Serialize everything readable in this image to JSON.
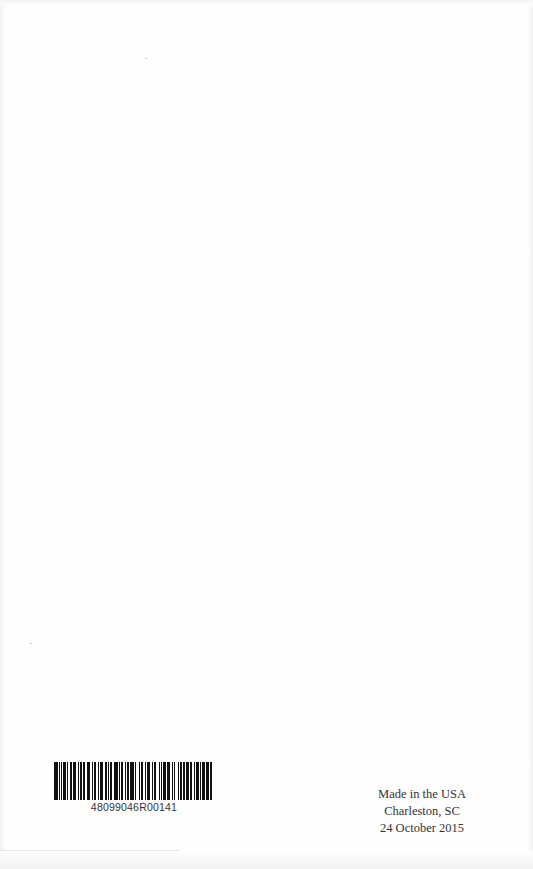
{
  "page": {
    "background": "#fefefe"
  },
  "barcode": {
    "number": "48099046R00141",
    "pattern": [
      3,
      1,
      1,
      1,
      1,
      1,
      2,
      1,
      1,
      2,
      1,
      1,
      3,
      1,
      1,
      1,
      2,
      1,
      1,
      2,
      3,
      1,
      1,
      1,
      2,
      1,
      1,
      1,
      3,
      1,
      2,
      1,
      1,
      1,
      1,
      2,
      3,
      1,
      1,
      1,
      2,
      1,
      1,
      1,
      2,
      1,
      3,
      1,
      1,
      2,
      1,
      1,
      2,
      1,
      1,
      1,
      3,
      1,
      1,
      1,
      2,
      2,
      1,
      1,
      1,
      1,
      2,
      1,
      3,
      1,
      1,
      1,
      1,
      2,
      1,
      1,
      2,
      1,
      1,
      1,
      3,
      1,
      1,
      2,
      1,
      1,
      2,
      1,
      1,
      1,
      2,
      1,
      3,
      1,
      1,
      1
    ]
  },
  "imprint": {
    "line1": "Made in the USA",
    "line2": "Charleston, SC",
    "line3": "24 October 2015"
  }
}
